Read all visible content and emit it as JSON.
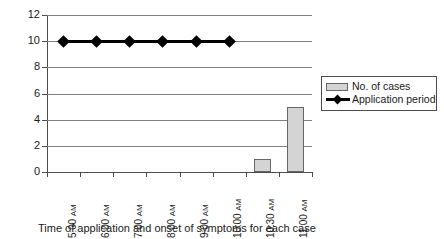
{
  "chart_data": {
    "type": "bar",
    "title": "",
    "subtitle": "",
    "xlabel": "Time of application and onset of symptoms for each case",
    "ylabel": "",
    "categories": [
      "5:00 AM",
      "6:00 AM",
      "7:00 AM",
      "8:00 AM",
      "9:00 AM",
      "10:00 AM",
      "10:30 AM",
      "11:00 AM"
    ],
    "series": [
      {
        "name": "No. of cases",
        "type": "bar",
        "values": [
          0,
          0,
          0,
          0,
          0,
          0,
          1,
          5
        ],
        "color": "#d4d4d4",
        "border_color": "#666666"
      },
      {
        "name": "Application period",
        "type": "line",
        "values": [
          10,
          10,
          10,
          10,
          10,
          10,
          null,
          null
        ],
        "color": "#000000",
        "marker": "diamond"
      }
    ],
    "ylim": [
      0,
      12
    ],
    "yticks": [
      0,
      2,
      4,
      6,
      8,
      10,
      12
    ],
    "ytick_labels": [
      "0",
      "2",
      "4",
      "6",
      "8",
      "10",
      "12"
    ],
    "grid": true,
    "grid_axis": "y",
    "legend_position": "right",
    "xtick_label_rotation": 90
  },
  "legend": {
    "entries": [
      {
        "label": "No. of cases",
        "swatch": "bar-swatch-icon"
      },
      {
        "label": "Application period",
        "swatch": "line-diamond-swatch-icon"
      }
    ]
  },
  "axis": {
    "y_labels": [
      "12",
      "10",
      "8",
      "6",
      "4",
      "2",
      "0"
    ],
    "x_labels": [
      "5:00 AM",
      "6:00 AM",
      "7:00 AM",
      "8:00 AM",
      "9:00 AM",
      "10:00 AM",
      "10:30 AM",
      "11:00 AM"
    ]
  },
  "caption": {
    "text": "Time of application and onset of symptoms for each case"
  }
}
